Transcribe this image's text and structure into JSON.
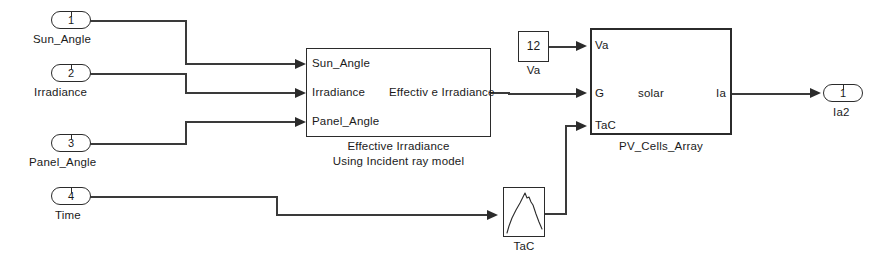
{
  "diagram": {
    "background_color": "#ffffff",
    "line_color": "#3a3a3a"
  },
  "input_ports": [
    {
      "number": "1",
      "label": "Sun_Angle"
    },
    {
      "number": "2",
      "label": "Irradiance"
    },
    {
      "number": "3",
      "label": "Panel_Angle"
    },
    {
      "number": "4",
      "label": "Time"
    }
  ],
  "output_ports": [
    {
      "number": "1",
      "label": "Ia2"
    }
  ],
  "blocks": {
    "effective_irradiance": {
      "inputs": [
        "Sun_Angle",
        "Irradiance",
        "Panel_Angle"
      ],
      "outputs": [
        "Effectiv e Irradiance"
      ],
      "caption_line1": "Effective Irradiance",
      "caption_line2": "Using Incident ray model"
    },
    "va_constant": {
      "value": "12",
      "caption": "Va"
    },
    "pv_cells_array": {
      "inputs": [
        "Va",
        "G",
        "TaC"
      ],
      "body_label": "solar",
      "outputs": [
        "Ia"
      ],
      "caption": "PV_Cells_Array"
    },
    "tac_lookup": {
      "caption": "TaC",
      "curve_type": "lookup-table-curve"
    }
  }
}
